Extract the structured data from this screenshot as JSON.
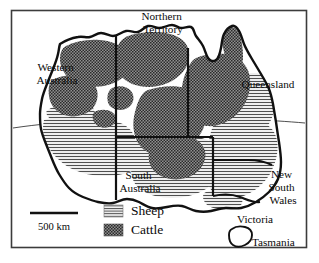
{
  "figure": {
    "kind": "thematic-map",
    "frame_color": "#3c3c3c",
    "background_color": "#ffffff",
    "coast_color": "#111111",
    "border_color": "#111111",
    "sheep_fill_color": "#ededed",
    "sheep_hatch_color": "#555555",
    "cattle_fill_color": "#8a8a8a",
    "cattle_stipple_color": "#2e2e2e"
  },
  "labels": {
    "states": [
      {
        "id": "western-australia",
        "lines": [
          "Western",
          "Australia"
        ],
        "x": 57,
        "y": 71
      },
      {
        "id": "northern-territory",
        "lines": [
          "Northern",
          "Territory"
        ],
        "x": 163,
        "y": 18
      },
      {
        "id": "queensland",
        "lines": [
          "Queensland"
        ],
        "x": 268,
        "y": 85
      },
      {
        "id": "south-australia",
        "lines": [
          "South",
          "Australia"
        ],
        "x": 140,
        "y": 181
      },
      {
        "id": "new-south-wales",
        "lines": [
          "New",
          "South",
          "Wales"
        ],
        "x": 283,
        "y": 182
      },
      {
        "id": "victoria",
        "lines": [
          "Victoria"
        ],
        "x": 255,
        "y": 219
      },
      {
        "id": "tasmania",
        "lines": [
          "Tasmania"
        ],
        "x": 272,
        "y": 241
      }
    ]
  },
  "legend": {
    "items": [
      {
        "id": "sheep",
        "label": "Sheep",
        "pattern": "horizontal-lines"
      },
      {
        "id": "cattle",
        "label": "Cattle",
        "pattern": "dark-stipple"
      }
    ]
  },
  "scale_bar": {
    "label": "500 km",
    "length_px": 48
  }
}
